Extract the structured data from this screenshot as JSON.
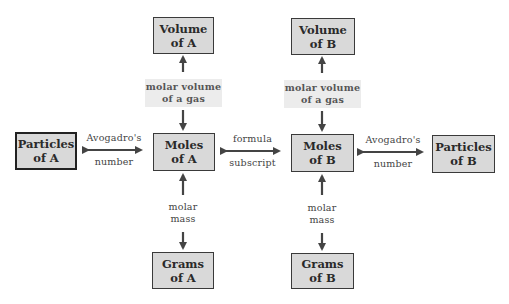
{
  "diagram": {
    "colors": {
      "box_fill": "#d9d9d9",
      "box_border": "#3a3a3a",
      "arrow": "#444444",
      "label_shade": "#ececec"
    },
    "nodes": {
      "volume_a": {
        "line1": "Volume",
        "line2": "of A"
      },
      "volume_b": {
        "line1": "Volume",
        "line2": "of B"
      },
      "particles_a": {
        "line1": "Particles",
        "line2": "of A"
      },
      "moles_a": {
        "line1": "Moles",
        "line2": "of A"
      },
      "moles_b": {
        "line1": "Moles",
        "line2": "of B"
      },
      "particles_b": {
        "line1": "Particles",
        "line2": "of B"
      },
      "grams_a": {
        "line1": "Grams",
        "line2": "of A"
      },
      "grams_b": {
        "line1": "Grams",
        "line2": "of B"
      }
    },
    "edges": {
      "molar_volume_a": {
        "line1": "molar volume",
        "line2": "of a gas"
      },
      "molar_volume_b": {
        "line1": "molar volume",
        "line2": "of a gas"
      },
      "avogadro_a": {
        "line1": "Avogadro's",
        "line2": "number"
      },
      "avogadro_b": {
        "line1": "Avogadro's",
        "line2": "number"
      },
      "formula": {
        "line1": "formula",
        "line2": "subscript"
      },
      "molar_mass_a": {
        "line1": "molar",
        "line2": "mass"
      },
      "molar_mass_b": {
        "line1": "molar",
        "line2": "mass"
      }
    }
  }
}
